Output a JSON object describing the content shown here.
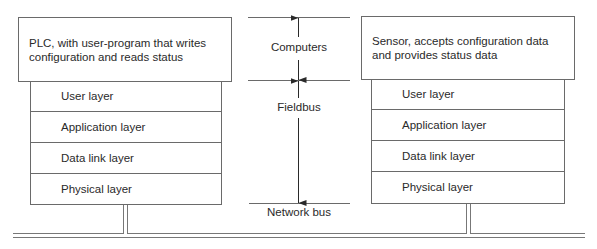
{
  "left_device": {
    "description": "PLC, with user-program that writes configuration and reads status",
    "layers": [
      "User layer",
      "Application layer",
      "Data link layer",
      "Physical layer"
    ]
  },
  "right_device": {
    "description": "Sensor, accepts configuration data and provides status data",
    "layers": [
      "User layer",
      "Application layer",
      "Data link layer",
      "Physical layer"
    ]
  },
  "middle": {
    "computers_label": "Computers",
    "fieldbus_label": "Fieldbus",
    "network_bus_label": "Network bus"
  }
}
